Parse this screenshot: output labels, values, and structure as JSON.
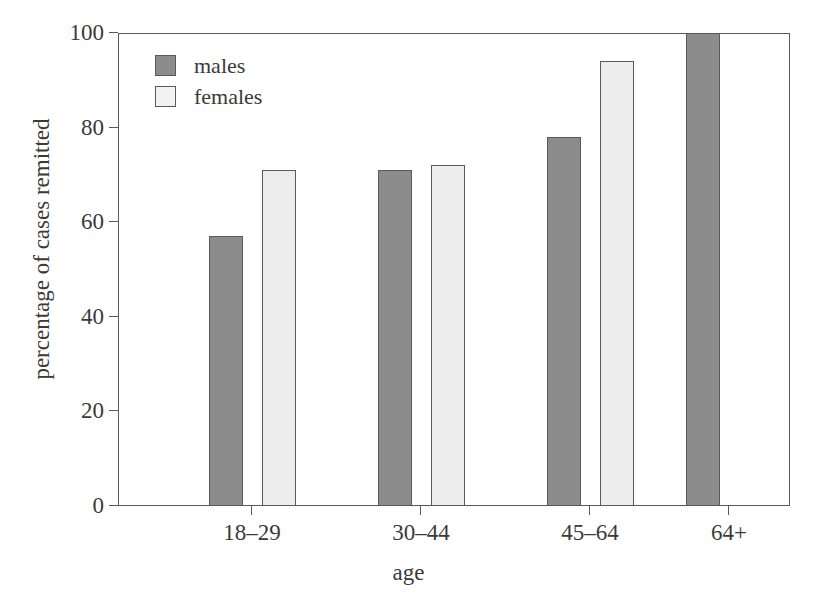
{
  "chart_data": {
    "type": "bar",
    "title": "",
    "subtitle": "",
    "xlabel": "age",
    "ylabel": "percentage of cases remitted",
    "categories": [
      "18–29",
      "30–44",
      "45–64",
      "64+"
    ],
    "series": [
      {
        "name": "males",
        "values": [
          57,
          71,
          78,
          100
        ],
        "color": "#8c8c8c"
      },
      {
        "name": "females",
        "values": [
          71,
          72,
          94,
          null
        ],
        "color": "#ededed"
      }
    ],
    "ylim": [
      0,
      100
    ],
    "yticks": [
      0,
      20,
      40,
      60,
      80,
      100
    ],
    "ytick_labels": [
      "0",
      "20",
      "40",
      "60",
      "80",
      "100"
    ],
    "grid": false,
    "legend_position": "top-left",
    "legend_entries": [
      "males",
      "females"
    ]
  },
  "axes": {
    "y_title": "percentage of cases remitted",
    "x_title": "age",
    "y_ticks": [
      {
        "value": 100,
        "label": "100"
      },
      {
        "value": 80,
        "label": "80"
      },
      {
        "value": 60,
        "label": "60"
      },
      {
        "value": 40,
        "label": "40"
      },
      {
        "value": 20,
        "label": "20"
      },
      {
        "value": 0,
        "label": "0"
      }
    ],
    "x_ticks": [
      {
        "label": "18–29"
      },
      {
        "label": "30–44"
      },
      {
        "label": "45–64"
      },
      {
        "label": "64+"
      }
    ]
  },
  "legend": {
    "items": [
      {
        "label": "males",
        "color": "#8c8c8c"
      },
      {
        "label": "females",
        "color": "#f2f2f2"
      }
    ]
  },
  "colors": {
    "males": "#8c8c8c",
    "females": "#ededed",
    "outline": "#5a5a5a",
    "text": "#3a3a3a",
    "background": "#ffffff"
  }
}
